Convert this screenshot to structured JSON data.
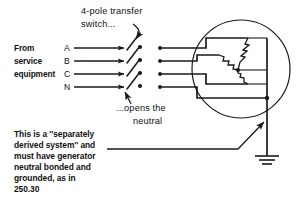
{
  "diagram": {
    "title_callout": {
      "line1": "4-pole transfer",
      "line2": "switch..."
    },
    "source_label": {
      "line1": "From",
      "line2": "service",
      "line3": "equipment"
    },
    "conductors": [
      {
        "id": "A",
        "label": "A",
        "y": 48
      },
      {
        "id": "B",
        "label": "B",
        "y": 61
      },
      {
        "id": "C",
        "label": "C",
        "y": 74
      },
      {
        "id": "N",
        "label": "N",
        "y": 87
      }
    ],
    "neutral_callout": {
      "line1": "...opens the",
      "line2": "neutral"
    },
    "note": {
      "line1": "This is a ''separately",
      "line2": "derived system'' and",
      "line3": "must have generator",
      "line4": "neutral bonded and",
      "line5": "grounded, as in",
      "line6": "250.30"
    },
    "generator": {
      "name": "wye-connected-generator",
      "winding_count": 3,
      "connection": "wye"
    },
    "ground_symbol": {
      "name": "earth-ground",
      "bars": 3
    },
    "colors": {
      "ink": "#1a1a1a",
      "text": "#111111",
      "background": "#ffffff"
    }
  }
}
